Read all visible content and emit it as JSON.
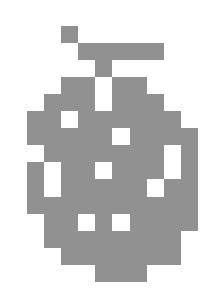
{
  "artwork": {
    "title": "Pixel Art Glyph",
    "style": "pixel-identicon",
    "background_color": "#ffffff",
    "fill_color": "#919191",
    "canvas": {
      "width": 224,
      "height": 294
    },
    "grid": {
      "columns": 10,
      "rows": 15,
      "cell_width": 17.1,
      "cell_height": 17.1,
      "origin_x": 27,
      "origin_y": 25.6
    },
    "matrix": [
      [
        0,
        0,
        1,
        0,
        0,
        0,
        0,
        0,
        0,
        0
      ],
      [
        0,
        0,
        0,
        1,
        1,
        1,
        1,
        1,
        0,
        0
      ],
      [
        0,
        0,
        0,
        0,
        1,
        0,
        0,
        0,
        0,
        0
      ],
      [
        0,
        0,
        1,
        1,
        0,
        1,
        1,
        0,
        0,
        0
      ],
      [
        0,
        1,
        1,
        1,
        0,
        1,
        1,
        1,
        0,
        0
      ],
      [
        1,
        1,
        0,
        1,
        1,
        1,
        1,
        1,
        1,
        0
      ],
      [
        1,
        1,
        1,
        1,
        1,
        0,
        1,
        1,
        1,
        1
      ],
      [
        0,
        1,
        1,
        1,
        1,
        1,
        1,
        1,
        0,
        1
      ],
      [
        1,
        0,
        1,
        1,
        0,
        1,
        1,
        1,
        0,
        1
      ],
      [
        1,
        0,
        1,
        1,
        1,
        1,
        1,
        0,
        1,
        1
      ],
      [
        1,
        1,
        1,
        1,
        1,
        1,
        1,
        1,
        1,
        1
      ],
      [
        0,
        1,
        1,
        0,
        1,
        0,
        1,
        1,
        1,
        1
      ],
      [
        0,
        1,
        1,
        1,
        1,
        1,
        1,
        1,
        1,
        0
      ],
      [
        0,
        0,
        1,
        1,
        1,
        1,
        1,
        1,
        1,
        0
      ],
      [
        0,
        0,
        0,
        0,
        1,
        1,
        1,
        0,
        0,
        0
      ]
    ]
  }
}
